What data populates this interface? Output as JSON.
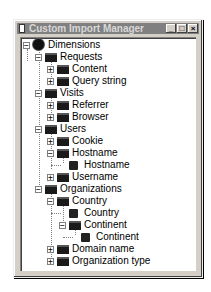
{
  "window": {
    "title": "Custom Import Manager",
    "controls": {
      "minimize": "_",
      "maximize": "□",
      "close": "×"
    }
  },
  "tree": [
    {
      "label": "Dimensions",
      "level": 0,
      "icon": "gear-icon",
      "expander": "minus"
    },
    {
      "label": "Requests",
      "level": 1,
      "icon": "folder-icon",
      "expander": "minus"
    },
    {
      "label": "Content",
      "level": 2,
      "icon": "folder-icon",
      "expander": "plus"
    },
    {
      "label": "Query string",
      "level": 2,
      "icon": "folder-icon",
      "expander": "plus"
    },
    {
      "label": "Visits",
      "level": 1,
      "icon": "folder-icon",
      "expander": "minus"
    },
    {
      "label": "Referrer",
      "level": 2,
      "icon": "folder-icon",
      "expander": "plus"
    },
    {
      "label": "Browser",
      "level": 2,
      "icon": "folder-icon",
      "expander": "plus"
    },
    {
      "label": "Users",
      "level": 1,
      "icon": "folder-icon",
      "expander": "minus"
    },
    {
      "label": "Cookie",
      "level": 2,
      "icon": "folder-icon",
      "expander": "plus"
    },
    {
      "label": "Hostname",
      "level": 2,
      "icon": "folder-icon",
      "expander": "minus"
    },
    {
      "label": "Hostname",
      "level": 3,
      "icon": "leaf-icon",
      "expander": "none"
    },
    {
      "label": "Username",
      "level": 2,
      "icon": "folder-icon",
      "expander": "plus"
    },
    {
      "label": "Organizations",
      "level": 1,
      "icon": "folder-icon",
      "expander": "minus"
    },
    {
      "label": "Country",
      "level": 2,
      "icon": "folder-icon",
      "expander": "minus"
    },
    {
      "label": "Country",
      "level": 3,
      "icon": "leaf-icon",
      "expander": "none"
    },
    {
      "label": "Continent",
      "level": 3,
      "icon": "folder-icon",
      "expander": "minus"
    },
    {
      "label": "Continent",
      "level": 4,
      "icon": "leaf-icon",
      "expander": "none"
    },
    {
      "label": "Domain name",
      "level": 2,
      "icon": "folder-icon",
      "expander": "plus"
    },
    {
      "label": "Organization type",
      "level": 2,
      "icon": "folder-icon",
      "expander": "plus"
    }
  ]
}
